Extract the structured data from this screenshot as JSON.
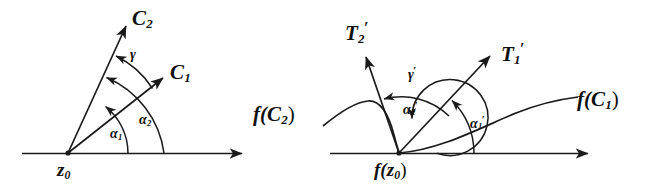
{
  "figure": {
    "background_color": "#ffffff",
    "ink_color": "#1a1a1a",
    "width": 651,
    "height": 191
  },
  "left_diagram": {
    "name": "z-plane",
    "vertex_label": "z",
    "vertex_sub": "0",
    "curves": [
      {
        "id": "C1",
        "base": "C",
        "sub": "1"
      },
      {
        "id": "C2",
        "base": "C",
        "sub": "2"
      }
    ],
    "angles": [
      {
        "id": "alpha1",
        "base": "α",
        "sub": "1",
        "prime": ""
      },
      {
        "id": "alpha2",
        "base": "α",
        "sub": "2",
        "prime": ""
      },
      {
        "id": "gamma",
        "base": "γ",
        "sub": "",
        "prime": ""
      }
    ]
  },
  "right_diagram": {
    "name": "w-plane",
    "vertex_label_prefix": "f(",
    "vertex_label_base": "z",
    "vertex_label_sub": "0",
    "vertex_label_suffix": ")",
    "tangents": [
      {
        "id": "T1p",
        "base": "T",
        "sub": "1",
        "prime": "′"
      },
      {
        "id": "T2p",
        "base": "T",
        "sub": "2",
        "prime": "′"
      }
    ],
    "image_curves": [
      {
        "id": "fC1",
        "prefix": "f(",
        "base": "C",
        "sub": "1",
        "suffix": ")"
      },
      {
        "id": "fC2",
        "prefix": "f(",
        "base": "C",
        "sub": "2",
        "suffix": ")"
      }
    ],
    "angles": [
      {
        "id": "alpha1p",
        "base": "α",
        "sub": "1",
        "prime": "′"
      },
      {
        "id": "alpha2p",
        "base": "α",
        "sub": "2",
        "prime": "′"
      },
      {
        "id": "gammap",
        "base": "γ",
        "sub": "",
        "prime": "′"
      }
    ]
  },
  "labels": {
    "C1": "C",
    "C1_sub": "1",
    "C2": "C",
    "C2_sub": "2",
    "gamma": "γ",
    "alpha1": "α",
    "alpha1_sub": "1",
    "alpha2": "α",
    "alpha2_sub": "2",
    "z0": "z",
    "z0_sub": "0",
    "T1": "T",
    "T1_sub": "1",
    "T1_prime": "′",
    "T2": "T",
    "T2_sub": "2",
    "T2_prime": "′",
    "gamma_prime": "γ",
    "gamma_prime_mark": "′",
    "alpha1p": "α",
    "alpha1p_sub": "1",
    "alpha1p_prime": "′",
    "alpha2p": "α",
    "alpha2p_sub": "2",
    "alpha2p_prime": "′",
    "fC1_open": "f(",
    "fC1_base": "C",
    "fC1_sub": "1",
    "fC1_close": ")",
    "fC2_open": "f(",
    "fC2_base": "C",
    "fC2_sub": "2",
    "fC2_close": ")",
    "fz0_open": "f(",
    "fz0_base": "z",
    "fz0_sub": "0",
    "fz0_close": ")"
  }
}
